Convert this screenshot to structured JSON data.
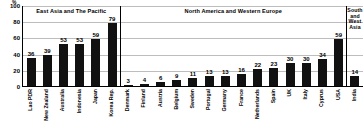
{
  "chart_data": {
    "type": "bar",
    "title": "",
    "subtitle": "",
    "xlabel": "",
    "ylabel": "%",
    "y_unit": "%",
    "ylim": [
      0,
      100
    ],
    "yticks": [
      0,
      20,
      40,
      60,
      80,
      100
    ],
    "grid": true,
    "legend": "none",
    "bar_color": "#111111",
    "grid_color": "#bdbdbd",
    "axis_color": "#000000",
    "categories": [
      "Lao PDR",
      "New Zealand",
      "Australia",
      "Indonesia",
      "Japan",
      "Korea Rep.",
      "Denmark",
      "Finland",
      "Austria",
      "Belgium",
      "Sweden",
      "Portugal",
      "Germany",
      "France",
      "Netherlands",
      "Spain",
      "UK",
      "Italy",
      "Cyprus",
      "USA",
      "India"
    ],
    "values": [
      36,
      39,
      53,
      53,
      59,
      79,
      3,
      4,
      6,
      9,
      11,
      13,
      13,
      16,
      22,
      23,
      30,
      30,
      34,
      59,
      14
    ],
    "groups": [
      {
        "label": "East Asia and The Pacific",
        "count": 6,
        "two_line": false
      },
      {
        "label": "North America and Western Europe",
        "count": 14,
        "two_line": false
      },
      {
        "label": "South and West Asia",
        "count": 1,
        "two_line": true
      }
    ]
  }
}
